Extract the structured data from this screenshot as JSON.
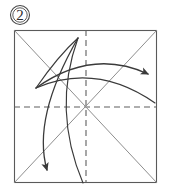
{
  "figure": {
    "kind": "origami-fold-diagram",
    "step_label": "2",
    "step_label_shape": "circled-number",
    "colors": {
      "background": "#ffffff",
      "frame_stroke": "#5a5a5a",
      "dashed_stroke": "#5f5f5f",
      "diagonal_stroke": "#8e8e8e",
      "arrow_stroke": "#3a3a3a",
      "badge_stroke": "#4a4a4a",
      "label_text": "#2b2b2b"
    },
    "paper": {
      "name": "square-sheet",
      "x": 14,
      "y": 30,
      "width": 143,
      "height": 153
    },
    "crease_lines": [
      {
        "name": "horizontal-center-crease",
        "style": "dashed",
        "x1": 14,
        "y1": 107,
        "x2": 157,
        "y2": 107
      },
      {
        "name": "vertical-center-crease",
        "style": "dashed",
        "x1": 86,
        "y1": 30,
        "x2": 86,
        "y2": 183
      },
      {
        "name": "diagonal-crease-tl-br",
        "style": "solid",
        "x1": 14,
        "y1": 30,
        "x2": 157,
        "y2": 183
      },
      {
        "name": "diagonal-crease-bl-tr",
        "style": "solid",
        "x1": 14,
        "y1": 183,
        "x2": 157,
        "y2": 30
      }
    ],
    "fold_arrows": [
      {
        "name": "fold-arrow-right",
        "path": "M 36 88 Q 92 48 148 74",
        "arrow_at": {
          "x": 148,
          "y": 74
        },
        "arrow_angle": 28
      },
      {
        "name": "fold-arrow-lower-left",
        "path": "M 78 38 Q 32 118 47 170",
        "arrow_at": {
          "x": 47,
          "y": 170
        },
        "arrow_angle": 108
      }
    ],
    "guide_curves": [
      {
        "name": "guide-curve-upper",
        "path": "M 36 88 Q 96 62 155 103"
      },
      {
        "name": "guide-curve-lower",
        "path": "M 78 38 Q 52 110 83 183"
      },
      {
        "name": "guide-curve-cusp-left",
        "path": "M 36 88 Q 58 56 78 38"
      }
    ]
  }
}
